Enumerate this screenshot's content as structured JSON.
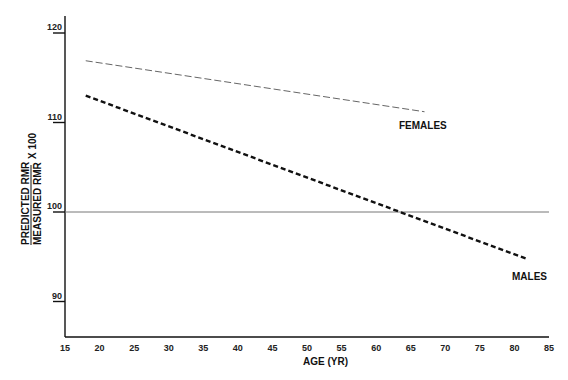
{
  "chart_data": {
    "type": "line",
    "title": "",
    "xlabel": "AGE (YR)",
    "ylabel": {
      "numerator": "PREDICTED RMR",
      "denominator": "MEASURED RMR",
      "multiplier": "X 100"
    },
    "xlim": [
      15,
      85
    ],
    "ylim": [
      86,
      121
    ],
    "x_ticks": [
      15,
      20,
      25,
      30,
      35,
      40,
      45,
      50,
      55,
      60,
      65,
      70,
      75,
      80,
      85
    ],
    "y_ticks": [
      90,
      100,
      110,
      120
    ],
    "grid": false,
    "legend": "inline labels",
    "reference_line": {
      "y": 100,
      "x_range": [
        15,
        85
      ],
      "style": "solid thin gray"
    },
    "series": [
      {
        "name": "FEMALES",
        "style": "thin long-dash gray",
        "color": "#666666",
        "x": [
          18,
          67
        ],
        "y": [
          116.9,
          111.2
        ]
      },
      {
        "name": "MALES",
        "style": "thick short-dash black",
        "color": "#111111",
        "x": [
          18,
          82
        ],
        "y": [
          113.0,
          94.7
        ]
      }
    ]
  },
  "labels": {
    "females": "FEMALES",
    "males": "MALES",
    "x_axis_title": "AGE (YR)",
    "y_numerator": "PREDICTED RMR",
    "y_denominator": "MEASURED RMR",
    "y_multiplier": "X 100",
    "x_ticks": [
      "15",
      "20",
      "25",
      "30",
      "35",
      "40",
      "45",
      "50",
      "55",
      "60",
      "65",
      "70",
      "75",
      "80",
      "85"
    ],
    "y_ticks": [
      "90",
      "100",
      "110",
      "120"
    ]
  }
}
